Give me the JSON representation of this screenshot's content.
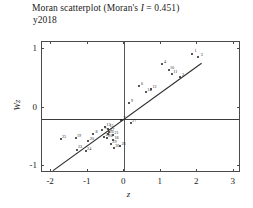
{
  "chart_data": {
    "type": "scatter",
    "title": "Moran scatterplot (Moran's I = 0.451)",
    "title_prefix": "Moran scatterplot (Moran's ",
    "title_italic": "I",
    "title_suffix": " = 0.451)",
    "subtitle": "y2018",
    "morans_i": 0.451,
    "xlabel": "z",
    "ylabel": "Wz",
    "xlim": [
      -2.25,
      3.2
    ],
    "ylim": [
      -1.12,
      1.12
    ],
    "xticks": [
      -2,
      -1,
      0,
      1,
      2,
      3
    ],
    "xticklabels": [
      "-2",
      "-1",
      "0",
      "1",
      "2",
      "3"
    ],
    "yticks": [
      -1,
      0,
      1
    ],
    "yticklabels": [
      "-1",
      "0",
      "1"
    ],
    "grid": false,
    "legend": false,
    "vline_x": 0,
    "hline_y": -0.2,
    "regression": {
      "slope": 0.451,
      "intercept": -0.2,
      "x_start": -1.95,
      "x_end": 2.12
    },
    "point_color": "#1c1c1c",
    "line_color": "#3c3c3c",
    "frame_color": "#4a4a4a",
    "points": [
      {
        "label": "1",
        "x": 1.86,
        "y": 0.92
      },
      {
        "label": "2",
        "x": 1.52,
        "y": 0.52
      },
      {
        "label": "3",
        "x": 2.03,
        "y": 0.86
      },
      {
        "label": "4",
        "x": 1.03,
        "y": 0.74
      },
      {
        "label": "5",
        "x": -0.6,
        "y": -0.38
      },
      {
        "label": "6",
        "x": 0.4,
        "y": 0.36
      },
      {
        "label": "7",
        "x": -0.09,
        "y": -0.21
      },
      {
        "label": "8",
        "x": -0.85,
        "y": -0.46
      },
      {
        "label": "9",
        "x": 0.12,
        "y": 0.08
      },
      {
        "label": "10",
        "x": 1.22,
        "y": 0.64
      },
      {
        "label": "11",
        "x": 1.31,
        "y": 0.57
      },
      {
        "label": "12",
        "x": 0.74,
        "y": 0.31
      },
      {
        "label": "13",
        "x": -0.52,
        "y": -0.34
      },
      {
        "label": "14",
        "x": 0.6,
        "y": 0.26
      },
      {
        "label": "15",
        "x": -0.44,
        "y": -0.36
      },
      {
        "label": "16",
        "x": -0.44,
        "y": -0.46
      },
      {
        "label": "17",
        "x": -0.42,
        "y": -0.42
      },
      {
        "label": "18",
        "x": -0.3,
        "y": -0.56
      },
      {
        "label": "19",
        "x": -1.33,
        "y": -0.52
      },
      {
        "label": "20",
        "x": -0.98,
        "y": -0.58
      },
      {
        "label": "21",
        "x": -0.3,
        "y": -0.47
      },
      {
        "label": "22",
        "x": -0.55,
        "y": -0.5
      },
      {
        "label": "23",
        "x": -1.3,
        "y": -0.72
      },
      {
        "label": "24",
        "x": -1.05,
        "y": -0.75
      },
      {
        "label": "25",
        "x": -1.74,
        "y": -0.54
      },
      {
        "label": "26",
        "x": -0.47,
        "y": -0.52
      },
      {
        "label": "27",
        "x": 0.18,
        "y": -0.26
      },
      {
        "label": "28",
        "x": -0.11,
        "y": -0.66
      },
      {
        "label": "29",
        "x": -0.36,
        "y": -0.63
      },
      {
        "label": "30",
        "x": -0.28,
        "y": -0.7
      }
    ]
  }
}
